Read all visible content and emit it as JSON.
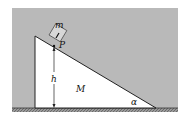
{
  "diagram": {
    "type": "physics-incline",
    "labels": {
      "block_mass": "m",
      "point": "P",
      "height": "h",
      "wedge_mass": "M",
      "angle": "α"
    },
    "colors": {
      "background": "#b8b8b8",
      "wedge": "#ffffff",
      "block": "#d9d9d9",
      "ground": "#8a8a8a",
      "line": "#222222"
    }
  }
}
